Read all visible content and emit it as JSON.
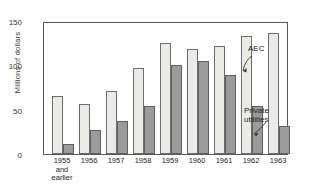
{
  "chart_data": {
    "type": "bar",
    "title": "",
    "subtitle": "",
    "xlabel": "",
    "ylabel": "Millions of dollars",
    "categories": [
      "1955\nand\nearlier",
      "1956",
      "1957",
      "1958",
      "1959",
      "1960",
      "1961",
      "1962",
      "1963"
    ],
    "ylim": [
      0,
      150
    ],
    "yticks": [
      0,
      50,
      100,
      150
    ],
    "ytick_labels": [
      "0",
      "50",
      "100",
      "150"
    ],
    "grid": false,
    "legend_position": "annotations-right",
    "series": [
      {
        "name": "AEC",
        "color": "#eceae6",
        "values": [
          66,
          57,
          72,
          99,
          127,
          120,
          124,
          135,
          139
        ]
      },
      {
        "name": "Private utilities",
        "color": "#9b9b9b",
        "values": [
          12,
          28,
          38,
          55,
          102,
          106,
          90,
          55,
          32
        ]
      }
    ],
    "annotations": [
      {
        "text": "AEC",
        "target_series": "AEC",
        "target_category": "1963"
      },
      {
        "text": "Private\nutilities",
        "target_series": "Private utilities",
        "target_category": "1963"
      }
    ]
  },
  "axis": {
    "y_title": "Millions of dollars",
    "y_tick_0": "0",
    "y_tick_1": "50",
    "y_tick_2": "100",
    "y_tick_3": "150"
  },
  "annotations": {
    "aec_label": "AEC",
    "private_label": "Private\nutilities"
  }
}
